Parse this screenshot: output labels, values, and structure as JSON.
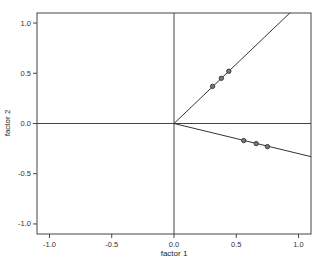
{
  "chart_data": {
    "type": "scatter",
    "title": "",
    "xlabel": "factor 1",
    "ylabel": "factor 2",
    "xlim": [
      -1.1,
      1.1
    ],
    "ylim": [
      -1.1,
      1.1
    ],
    "xticks": [
      "-1.0",
      "-0.5",
      "0.0",
      "0.5",
      "1.0"
    ],
    "yticks": [
      "1.0",
      "0.5",
      "0.0",
      "-0.5",
      "-1.0"
    ],
    "xtick_values": [
      -1.0,
      -0.5,
      0.0,
      0.5,
      1.0
    ],
    "ytick_values": [
      1.0,
      0.5,
      0.0,
      -0.5,
      -1.0
    ],
    "grid": false,
    "reference_lines": {
      "x": 0.0,
      "y": 0.0
    },
    "series": [
      {
        "name": "factor direction 1",
        "points": [
          [
            0.31,
            0.37
          ],
          [
            0.38,
            0.45
          ],
          [
            0.44,
            0.52
          ]
        ],
        "line": {
          "from": [
            0.0,
            0.0
          ],
          "to": [
            0.93,
            1.1
          ]
        }
      },
      {
        "name": "factor direction 2",
        "points": [
          [
            0.56,
            -0.17
          ],
          [
            0.66,
            -0.2
          ],
          [
            0.75,
            -0.23
          ]
        ],
        "line": {
          "from": [
            0.0,
            0.0
          ],
          "to": [
            1.1,
            -0.33
          ]
        }
      }
    ],
    "colors": {
      "line": "#333333",
      "axis": "#444444",
      "marker": "#333333"
    }
  }
}
